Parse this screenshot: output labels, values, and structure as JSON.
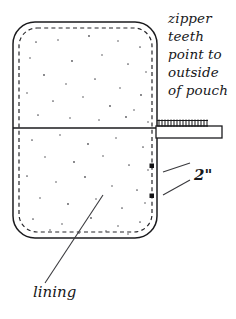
{
  "diagram": {
    "type": "line-drawing",
    "canvas": {
      "width": 236,
      "height": 319,
      "background": "#ffffff"
    },
    "ink_color": "#1b1b1e",
    "annotations": {
      "zipper_note": {
        "lines": [
          "zipper",
          "teeth",
          "point to",
          "outside",
          "of pouch"
        ],
        "style": "italic"
      },
      "dimension": {
        "label": "2\"",
        "value": 2,
        "unit": "inch",
        "style": "bold-italic"
      },
      "lining": {
        "label": "lining",
        "style": "italic"
      }
    },
    "parts": {
      "pouch_body": {
        "name": "pouch",
        "shape": "rounded-rectangle",
        "x": 13,
        "y": 22,
        "width": 144,
        "height": 216,
        "corner_radius": 22
      },
      "lining_edge": {
        "name": "lining",
        "shape": "rounded-rectangle-dashed",
        "x": 19,
        "y": 28,
        "width": 133,
        "height": 204,
        "corner_radius": 18
      },
      "fold_line": {
        "name": "zipper-seam",
        "x1": 13,
        "y1": 128,
        "x2": 157,
        "y2": 128
      },
      "zipper": {
        "name": "zipper-tape",
        "x": 156,
        "y": 120,
        "width": 66,
        "height": 17,
        "teeth_count": 17,
        "teeth_direction": "up-outside"
      },
      "dimension_marks": [
        {
          "x": 152,
          "y": 166
        },
        {
          "x": 152,
          "y": 196
        }
      ]
    },
    "texture": {
      "name": "fabric-speckle",
      "dots": [
        [
          36,
          42
        ],
        [
          58,
          40
        ],
        [
          89,
          36
        ],
        [
          118,
          41
        ],
        [
          140,
          47
        ],
        [
          30,
          58
        ],
        [
          72,
          61
        ],
        [
          102,
          55
        ],
        [
          128,
          64
        ],
        [
          146,
          72
        ],
        [
          44,
          75
        ],
        [
          66,
          84
        ],
        [
          95,
          79
        ],
        [
          120,
          88
        ],
        [
          141,
          95
        ],
        [
          27,
          93
        ],
        [
          53,
          101
        ],
        [
          83,
          97
        ],
        [
          110,
          106
        ],
        [
          134,
          110
        ],
        [
          38,
          115
        ],
        [
          70,
          118
        ],
        [
          99,
          120
        ],
        [
          126,
          117
        ],
        [
          148,
          122
        ],
        [
          32,
          140
        ],
        [
          60,
          135
        ],
        [
          88,
          144
        ],
        [
          116,
          138
        ],
        [
          143,
          147
        ],
        [
          45,
          157
        ],
        [
          74,
          162
        ],
        [
          103,
          156
        ],
        [
          129,
          165
        ],
        [
          148,
          170
        ],
        [
          27,
          176
        ],
        [
          56,
          182
        ],
        [
          85,
          177
        ],
        [
          112,
          186
        ],
        [
          137,
          190
        ],
        [
          40,
          198
        ],
        [
          68,
          204
        ],
        [
          96,
          199
        ],
        [
          122,
          208
        ],
        [
          145,
          203
        ],
        [
          33,
          219
        ],
        [
          62,
          224
        ],
        [
          91,
          218
        ],
        [
          118,
          226
        ],
        [
          140,
          222
        ],
        [
          50,
          230
        ],
        [
          79,
          233
        ],
        [
          106,
          231
        ],
        [
          128,
          234
        ]
      ]
    },
    "leader_lines": {
      "lining": {
        "x1": 45,
        "y1": 283,
        "x2": 103,
        "y2": 195
      },
      "dimension_upper": {
        "x1": 163,
        "y1": 172,
        "x2": 190,
        "y2": 163
      },
      "dimension_lower": {
        "x1": 163,
        "y1": 195,
        "x2": 190,
        "y2": 180
      }
    }
  }
}
